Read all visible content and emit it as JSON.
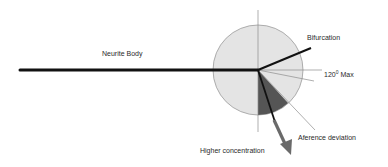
{
  "diagram": {
    "labels": {
      "neurite_body": "Neurite Body",
      "bifurcation": "Bifurcation",
      "max_angle_value": "120",
      "max_angle_degree": "0",
      "max_angle_suffix": " Max",
      "afference_deviation": "Aference deviation",
      "higher_concentration": "Higher concentration"
    },
    "colors": {
      "circle_fill": "#e4e4e4",
      "circle_stroke": "#9a9a9a",
      "wedge_fill": "#555555",
      "neurite_line": "#111111",
      "thin_line": "#8c8c8c",
      "arrow": "#6a6a6a",
      "text": "#2a2a2a"
    }
  }
}
